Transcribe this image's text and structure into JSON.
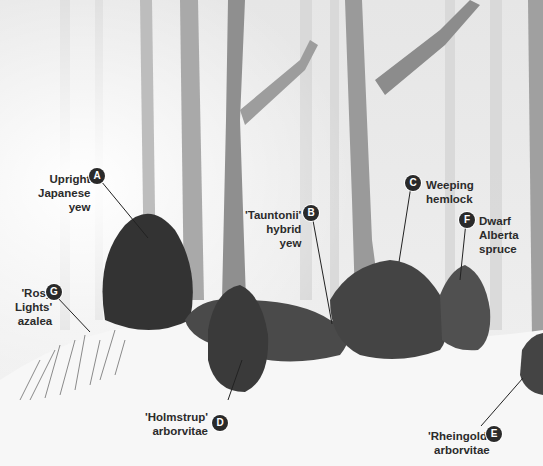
{
  "figure": {
    "palette": {
      "badge": "#2a2a2a",
      "text": "#2b2b2b",
      "snow": "#f7f7f7",
      "foliage": "#3c3c3c"
    }
  },
  "callouts": [
    {
      "id": "A",
      "lines": [
        "Upright",
        "Japanese",
        "yew"
      ]
    },
    {
      "id": "B",
      "lines": [
        "'Tauntonii'",
        "hybrid",
        "yew"
      ]
    },
    {
      "id": "C",
      "lines": [
        "Weeping",
        "hemlock"
      ]
    },
    {
      "id": "D",
      "lines": [
        "'Holmstrup'",
        "arborvitae"
      ]
    },
    {
      "id": "E",
      "lines": [
        "'Rheingold'",
        "arborvitae"
      ]
    },
    {
      "id": "F",
      "lines": [
        "Dwarf",
        "Alberta",
        "spruce"
      ]
    },
    {
      "id": "G",
      "lines": [
        "'Rosy",
        "Lights'",
        "azalea"
      ]
    }
  ]
}
